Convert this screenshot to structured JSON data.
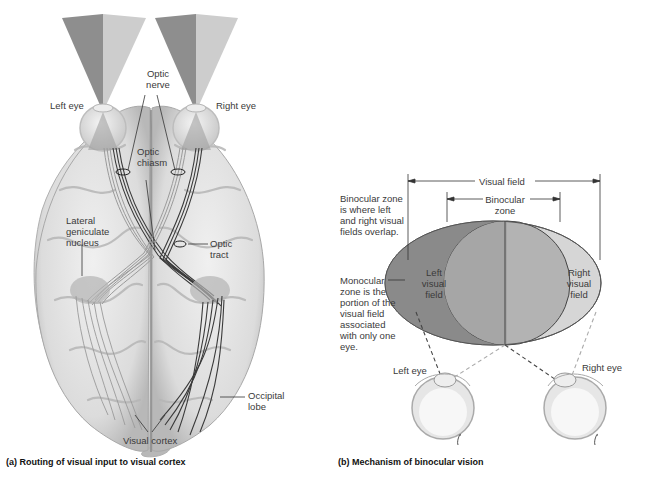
{
  "panel_a": {
    "caption": "(a) Routing of visual input to visual cortex",
    "labels": {
      "left_eye": "Left eye",
      "right_eye": "Right eye",
      "optic_nerve": "Optic\nnerve",
      "optic_chiasm": "Optic\nchiasm",
      "lateral_geniculate_nucleus": "Lateral\ngeniculate\nnucleus",
      "optic_tract": "Optic\ntract",
      "occipital_lobe": "Occipital\nlobe",
      "visual_cortex": "Visual cortex"
    }
  },
  "panel_b": {
    "caption": "(b) Mechanism of binocular vision",
    "labels": {
      "visual_field": "Visual field",
      "binocular_zone": "Binocular\nzone",
      "binocular_zone_desc": "Binocular zone\nis where left\nand right visual\nfields overlap.",
      "monocular_zone_desc": "Monocular\nzone is the\nportion of the\nvisual field\nassociated\nwith only one\neye.",
      "left_visual_field": "Left\nvisual\nfield",
      "right_visual_field": "Right\nvisual\nfield",
      "left_eye": "Left eye",
      "right_eye": "Right eye"
    }
  },
  "colors": {
    "left_field_dark": "#8a8a8a",
    "right_field_light": "#d6d6d6",
    "overlap": "#b3b3b3",
    "brain": "#e6e6e6",
    "brain_shadow": "#bdbdbd",
    "nerve_dark": "#3a3a3a",
    "nerve_light": "#9a9a9a"
  }
}
